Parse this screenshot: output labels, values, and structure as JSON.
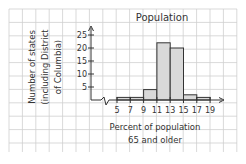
{
  "chart_data": {
    "type": "bar",
    "subtype": "histogram",
    "title": "Population",
    "xlabel": "Percent of population 65 and older",
    "xlabel_lines": [
      "Percent of population",
      "65 and older"
    ],
    "ylabel": "Number of states (including District of Columbia)",
    "ylabel_lines": [
      "Number of states",
      "(including District",
      "of Columbia)"
    ],
    "x_ticks": [
      5,
      7,
      9,
      11,
      13,
      15,
      17,
      19
    ],
    "y_ticks": [
      5,
      10,
      15,
      20,
      25
    ],
    "ylim": [
      0,
      27
    ],
    "xlim": [
      5,
      19
    ],
    "x_axis_break": true,
    "grid": true,
    "bins": [
      {
        "range": [
          5,
          7
        ],
        "value": 1
      },
      {
        "range": [
          7,
          9
        ],
        "value": 1
      },
      {
        "range": [
          9,
          11
        ],
        "value": 4
      },
      {
        "range": [
          11,
          13
        ],
        "value": 22
      },
      {
        "range": [
          13,
          15
        ],
        "value": 20
      },
      {
        "range": [
          15,
          17
        ],
        "value": 2
      },
      {
        "range": [
          17,
          19
        ],
        "value": 1
      }
    ],
    "categories": [
      "5-7",
      "7-9",
      "9-11",
      "11-13",
      "13-15",
      "15-17",
      "17-19"
    ],
    "values": [
      1,
      1,
      4,
      22,
      20,
      2,
      1
    ]
  },
  "colors": {
    "bar_fill": "#d9d9d9",
    "bar_stroke": "#333333",
    "grid": "#cfcfcf",
    "axis": "#333333"
  }
}
